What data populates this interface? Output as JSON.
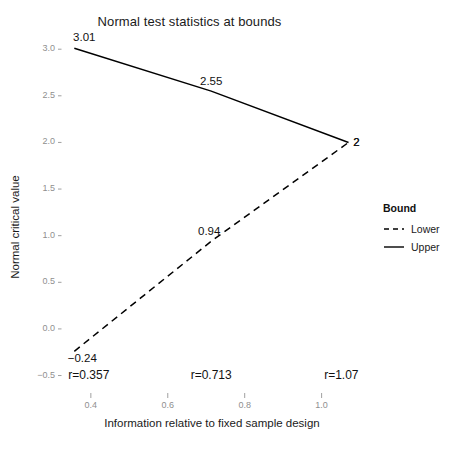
{
  "chart_data": {
    "type": "line",
    "title": "Normal test statistics at bounds",
    "xlabel": "Information relative to fixed sample design",
    "ylabel": "Normal critical value",
    "xlim": [
      0.325,
      1.105
    ],
    "ylim": [
      -0.58,
      3.12
    ],
    "grid": false,
    "legend_position": "right",
    "legend_title": "Bound",
    "x_ticks": [
      "0.4",
      "0.6",
      "0.8",
      "1.0"
    ],
    "x_tick_values": [
      0.4,
      0.6,
      0.8,
      1.0
    ],
    "y_ticks": [
      "-0.5",
      "0.0",
      "0.5",
      "1.0",
      "1.5",
      "2.0",
      "2.5",
      "3.0"
    ],
    "y_tick_values": [
      -0.5,
      0.0,
      0.5,
      1.0,
      1.5,
      2.0,
      2.5,
      3.0
    ],
    "x": [
      0.357,
      0.713,
      1.07
    ],
    "series": [
      {
        "name": "Upper",
        "linestyle": "solid",
        "color": "#000000",
        "values": [
          3.01,
          2.55,
          2.0
        ],
        "point_labels": [
          "3.01",
          "2.55",
          "2"
        ]
      },
      {
        "name": "Lower",
        "linestyle": "dashed",
        "color": "#000000",
        "values": [
          -0.24,
          0.94,
          2.0
        ],
        "point_labels": [
          "-0.24",
          "0.94",
          "2"
        ]
      }
    ],
    "annotations": [
      {
        "text": "r=0.357",
        "x": 0.357,
        "y": -0.5
      },
      {
        "text": "r=0.713",
        "x": 0.713,
        "y": -0.5
      },
      {
        "text": "r=1.07",
        "x": 1.07,
        "y": -0.5
      }
    ]
  },
  "legend": {
    "title": "Bound",
    "items": [
      {
        "label": "Lower",
        "style": "dashed"
      },
      {
        "label": "Upper",
        "style": "solid"
      }
    ]
  }
}
